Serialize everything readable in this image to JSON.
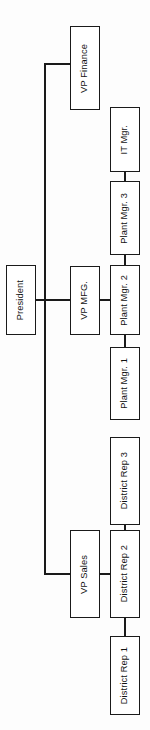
{
  "diagram": {
    "type": "organizational-chart",
    "orientation": "rotated-90-vertical-text",
    "background_color": "#fdfdfd",
    "line_color": "#1a1a1a",
    "box_fill": "#ffffff",
    "nodes": {
      "president": {
        "label": "President"
      },
      "vp_finance": {
        "label": "VP Finance"
      },
      "vp_mfg": {
        "label": "VP MFG."
      },
      "vp_sales": {
        "label": "VP Sales"
      },
      "it_mgr": {
        "label": "IT Mgr."
      },
      "plant_mgr_3": {
        "label": "Plant Mgr. 3"
      },
      "plant_mgr_2": {
        "label": "Plant Mgr. 2"
      },
      "plant_mgr_1": {
        "label": "Plant Mgr. 1"
      },
      "district_rep_3": {
        "label": "District Rep 3"
      },
      "district_rep_2": {
        "label": "District Rep 2"
      },
      "district_rep_1": {
        "label": "District Rep 1"
      }
    },
    "hierarchy": [
      {
        "parent": "president",
        "children": [
          "vp_finance",
          "vp_mfg",
          "vp_sales"
        ]
      },
      {
        "parent": "vp_mfg",
        "children": [
          "plant_mgr_1",
          "plant_mgr_2",
          "plant_mgr_3"
        ]
      },
      {
        "parent": "plant_mgr_3",
        "children": [
          "it_mgr"
        ]
      },
      {
        "parent": "vp_sales",
        "children": [
          "district_rep_1",
          "district_rep_2",
          "district_rep_3"
        ]
      }
    ]
  }
}
